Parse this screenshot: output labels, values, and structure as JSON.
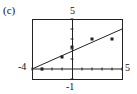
{
  "panel_label": "(c)",
  "chart_data": {
    "type": "scatter",
    "title": "",
    "xlabel": "",
    "ylabel": "",
    "xlim": [
      -4,
      5
    ],
    "ylim": [
      -1,
      5
    ],
    "tick_labels": {
      "xmin": "-4",
      "xmax": "5",
      "ymin": "-1",
      "ymax": "5"
    },
    "grid": false,
    "series": [
      {
        "name": "data points",
        "x": [
          -3,
          -1,
          0,
          2,
          4
        ],
        "y": [
          0,
          1.2,
          2.2,
          3,
          3
        ]
      },
      {
        "name": "regression line",
        "type": "line",
        "x": [
          -4,
          5
        ],
        "y": [
          0,
          4
        ]
      }
    ]
  }
}
